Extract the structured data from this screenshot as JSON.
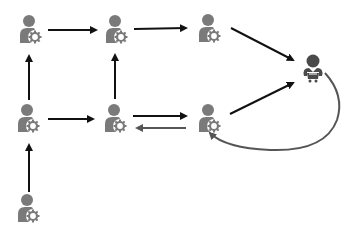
{
  "diagram": {
    "title": "",
    "colors": {
      "node": "#7a7a7a",
      "node_dark": "#6a6a6a",
      "customer": "#4a4a4a",
      "arrow": "#111111",
      "return_arrow": "#555555",
      "background": "#ffffff"
    },
    "nodes": [
      {
        "id": "n1",
        "type": "user-gear",
        "x": 29,
        "y": 31
      },
      {
        "id": "n2",
        "type": "user-gear",
        "x": 115,
        "y": 31
      },
      {
        "id": "n3",
        "type": "user-gear",
        "x": 208,
        "y": 30
      },
      {
        "id": "n4",
        "type": "user-gear",
        "x": 27,
        "y": 120
      },
      {
        "id": "n5",
        "type": "user-gear",
        "x": 114,
        "y": 120
      },
      {
        "id": "n6",
        "type": "user-gear",
        "x": 208,
        "y": 120
      },
      {
        "id": "n7",
        "type": "user-gear",
        "x": 27,
        "y": 210
      },
      {
        "id": "c1",
        "type": "customer-cart",
        "x": 313,
        "y": 70
      }
    ],
    "edges": [
      {
        "from": "n1",
        "to": "n2",
        "style": "solid"
      },
      {
        "from": "n2",
        "to": "n3",
        "style": "solid"
      },
      {
        "from": "n3",
        "to": "c1",
        "style": "solid"
      },
      {
        "from": "n4",
        "to": "n1",
        "style": "solid"
      },
      {
        "from": "n5",
        "to": "n2",
        "style": "solid"
      },
      {
        "from": "n4",
        "to": "n5",
        "style": "solid"
      },
      {
        "from": "n5",
        "to": "n6",
        "style": "solid"
      },
      {
        "from": "n6",
        "to": "n5",
        "style": "return"
      },
      {
        "from": "n6",
        "to": "c1",
        "style": "solid"
      },
      {
        "from": "n7",
        "to": "n4",
        "style": "solid"
      },
      {
        "from": "c1",
        "to": "n6",
        "style": "curved-return"
      }
    ]
  }
}
